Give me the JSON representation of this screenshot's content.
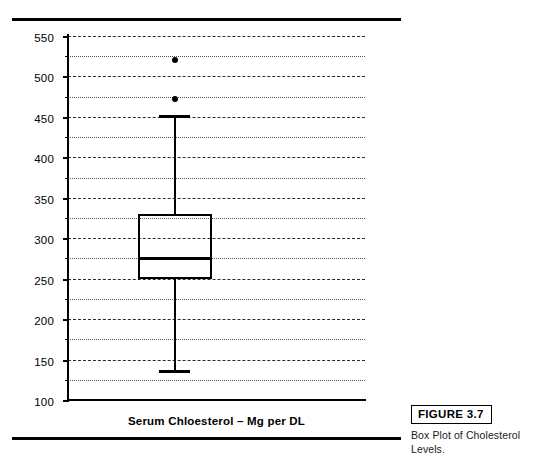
{
  "figure": {
    "number_label": "FIGURE 3.7",
    "caption": "Box Plot of Cholesterol Levels."
  },
  "colors": {
    "ink": "#000000",
    "gridline": "#2b2b2b",
    "background": "#ffffff"
  },
  "chart_data": {
    "type": "box",
    "title": "",
    "xlabel": "Serum Chloesterol – Mg per DL",
    "ylabel": "",
    "ylim": [
      100,
      550
    ],
    "y_major_step": 50,
    "y_minor_step": 25,
    "grid": true,
    "grid_major_style": "dashed",
    "grid_minor_style": "dotted",
    "legend": "none",
    "y_major_ticks": [
      550,
      500,
      450,
      400,
      350,
      300,
      250,
      200,
      150,
      100
    ],
    "y_major_tick_labels": [
      "550",
      "500",
      "450",
      "400",
      "350",
      "300",
      "250",
      "200",
      "150",
      "100"
    ],
    "y_minor_ticks": [
      525,
      475,
      425,
      375,
      325,
      275,
      225,
      175,
      125
    ],
    "categories": [
      "Serum Chloesterol – Mg per DL"
    ],
    "boxes": [
      {
        "name": "Serum Cholesterol",
        "whisker_low": 135,
        "q1": 250,
        "median": 275,
        "q3": 330,
        "whisker_high": 450,
        "outliers": [
          472,
          520
        ],
        "center_x_fraction": 0.36,
        "box_width_fraction": 0.25
      }
    ]
  }
}
